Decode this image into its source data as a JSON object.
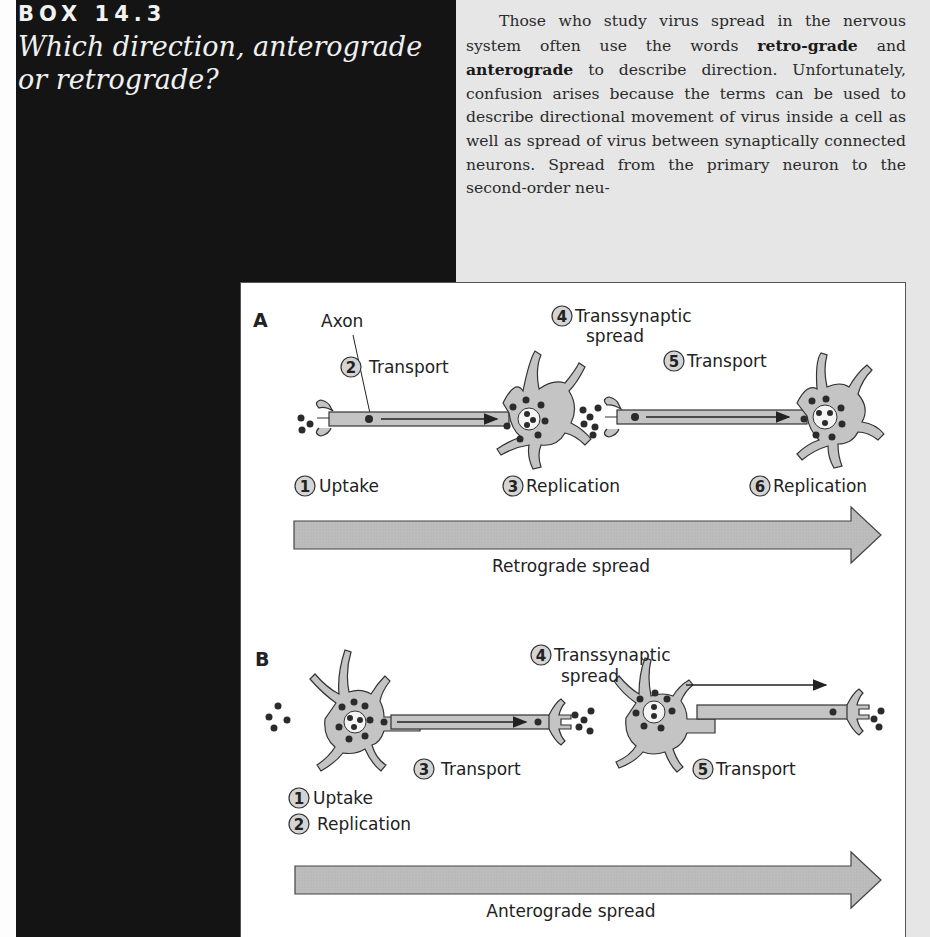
{
  "box": {
    "label": "BOX 14.3",
    "title_line1": "Which direction, anterograde",
    "title_line2": "or retrograde?"
  },
  "body": {
    "paragraph_parts": [
      "Those who study virus spread in the nervous system often use the words ",
      "retro-grade",
      " and ",
      "anterograde",
      " to describe direction. Unfortunately, confusion arises because the terms can be used to describe directional movement of virus inside a cell as well as spread of virus between synaptically connected neurons. Spread from the primary neuron to the second-order neu-"
    ]
  },
  "figure": {
    "panel_a": {
      "letter": "A",
      "axon_label": "Axon",
      "steps": [
        {
          "num": "1",
          "label": "Uptake"
        },
        {
          "num": "2",
          "label": "Transport"
        },
        {
          "num": "3",
          "label": "Replication"
        },
        {
          "num": "4",
          "label": "Transsynaptic",
          "label2": "spread"
        },
        {
          "num": "5",
          "label": "Transport"
        },
        {
          "num": "6",
          "label": "Replication"
        }
      ],
      "arrow_label": "Retrograde spread"
    },
    "panel_b": {
      "letter": "B",
      "steps": [
        {
          "num": "1",
          "label": "Uptake"
        },
        {
          "num": "2",
          "label": "Replication"
        },
        {
          "num": "3",
          "label": "Transport"
        },
        {
          "num": "4",
          "label": "Transsynaptic",
          "label2": "spread"
        },
        {
          "num": "5",
          "label": "Transport"
        }
      ],
      "arrow_label": "Anterograde spread"
    }
  },
  "colors": {
    "dark_panel": "#141414",
    "text_panel": "#e6e6e6",
    "neuron_fill": "#c4c4c4",
    "arrow_fill": "#bdbdbd",
    "virus_dot": "#2b2b2b"
  }
}
